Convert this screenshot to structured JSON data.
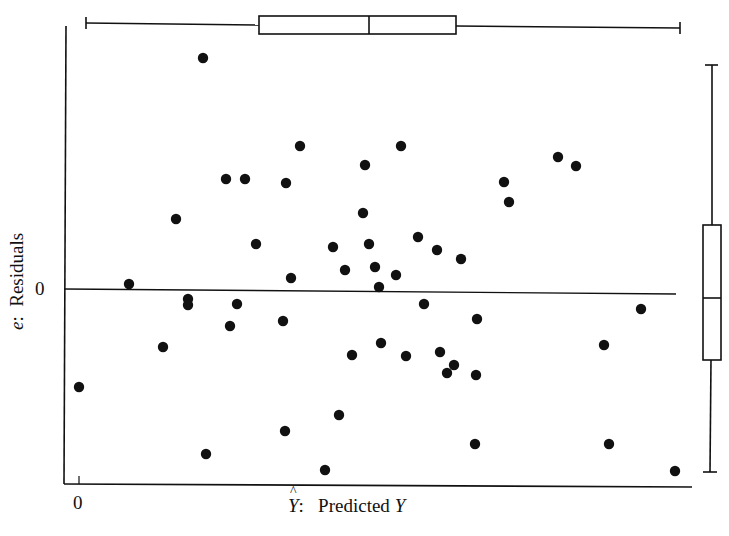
{
  "chart_data": {
    "type": "scatter",
    "title": "",
    "xlabel": "Ŷ: Predicted Y",
    "xlabel_parts": {
      "symbol": "Y",
      "hat": true,
      "sep": ":",
      "text": "Predicted",
      "var": "Y"
    },
    "ylabel": "e: Residuals",
    "ylabel_parts": {
      "symbol": "e",
      "sep": ":",
      "text": "Residuals"
    },
    "x_ticks": [
      "0"
    ],
    "y_ticks": [
      "0"
    ],
    "grid": false,
    "legend": null,
    "reference_line": {
      "y": 0,
      "style": "solid horizontal at residual 0"
    },
    "units_note": "Values estimated from pixel positions; x relative to x-axis 0 tick, y relative to zero residual line (arbitrary units, 1 unit = 100 px)",
    "points": [
      {
        "x": 1.24,
        "y": 2.33
      },
      {
        "x": 2.21,
        "y": 1.45
      },
      {
        "x": 3.22,
        "y": 1.45
      },
      {
        "x": 2.86,
        "y": 1.26
      },
      {
        "x": 4.79,
        "y": 1.34
      },
      {
        "x": 4.97,
        "y": 1.25
      },
      {
        "x": 1.47,
        "y": 1.12
      },
      {
        "x": 1.66,
        "y": 1.12
      },
      {
        "x": 2.07,
        "y": 1.08
      },
      {
        "x": 4.25,
        "y": 1.09
      },
      {
        "x": 4.3,
        "y": 0.89
      },
      {
        "x": 2.84,
        "y": 0.78
      },
      {
        "x": 0.97,
        "y": 0.72
      },
      {
        "x": 3.39,
        "y": 0.54
      },
      {
        "x": 1.77,
        "y": 0.47
      },
      {
        "x": 2.54,
        "y": 0.44
      },
      {
        "x": 2.9,
        "y": 0.47
      },
      {
        "x": 3.58,
        "y": 0.41
      },
      {
        "x": 3.82,
        "y": 0.32
      },
      {
        "x": 2.66,
        "y": 0.21
      },
      {
        "x": 2.96,
        "y": 0.24
      },
      {
        "x": 3.17,
        "y": 0.16
      },
      {
        "x": 2.12,
        "y": 0.13
      },
      {
        "x": 0.5,
        "y": 0.07
      },
      {
        "x": 3.0,
        "y": 0.04
      },
      {
        "x": 1.09,
        "y": -0.08
      },
      {
        "x": 1.09,
        "y": -0.14
      },
      {
        "x": 1.58,
        "y": -0.13
      },
      {
        "x": 3.45,
        "y": -0.13
      },
      {
        "x": 5.62,
        "y": -0.18
      },
      {
        "x": 2.04,
        "y": -0.3
      },
      {
        "x": 3.98,
        "y": -0.28
      },
      {
        "x": 1.51,
        "y": -0.35
      },
      {
        "x": 0.84,
        "y": -0.56
      },
      {
        "x": 5.25,
        "y": -0.54
      },
      {
        "x": 3.02,
        "y": -0.52
      },
      {
        "x": 3.61,
        "y": -0.61
      },
      {
        "x": 2.73,
        "y": -0.64
      },
      {
        "x": 3.27,
        "y": -0.65
      },
      {
        "x": 3.75,
        "y": -0.74
      },
      {
        "x": 3.68,
        "y": -0.82
      },
      {
        "x": 3.97,
        "y": -0.84
      },
      {
        "x": 0.0,
        "y": -0.96
      },
      {
        "x": 2.6,
        "y": -1.24
      },
      {
        "x": 2.06,
        "y": -1.4
      },
      {
        "x": 3.96,
        "y": -1.53
      },
      {
        "x": 5.3,
        "y": -1.53
      },
      {
        "x": 1.27,
        "y": -1.63
      },
      {
        "x": 2.46,
        "y": -1.79
      },
      {
        "x": 5.96,
        "y": -1.8
      }
    ],
    "marginal_boxplots": {
      "x_top": {
        "whisker_low": 0.07,
        "q1": 1.8,
        "median": 2.9,
        "q3": 3.77,
        "whisker_high": 6.01
      },
      "y_right": {
        "whisker_low": -1.81,
        "q1": -0.69,
        "median": -0.07,
        "q3": 0.66,
        "whisker_high": 2.26
      }
    }
  },
  "labels": {
    "y_symbol": "e",
    "y_sep": ":",
    "y_text": "Residuals",
    "y_tick0": "0",
    "x_tick0": "0",
    "x_symbol": "Y",
    "x_sep": ":",
    "x_text": "Predicted",
    "x_var": "Y"
  },
  "style": {
    "ink": "#111111",
    "background": "#ffffff",
    "pixel_map": {
      "x0_px": 79,
      "x_scale_px": 100,
      "y0_px": 291,
      "y_scale_px": 100
    }
  }
}
